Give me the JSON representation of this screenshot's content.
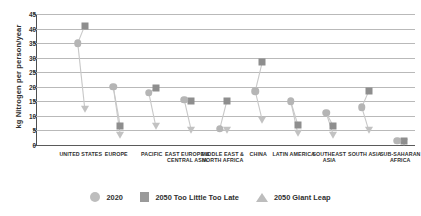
{
  "chart_data": {
    "type": "scatter",
    "title": "",
    "xlabel": "",
    "ylabel": "kg Nitrogen per person/year",
    "ylim": [
      0,
      45
    ],
    "ytick_step": 5,
    "yticks": [
      "45",
      "40",
      "35",
      "30",
      "25",
      "20",
      "15",
      "10",
      "5",
      "0"
    ],
    "grid": true,
    "legend_position": "bottom",
    "categories": [
      "UNITED STATES",
      "EUROPE",
      "PACIFIC",
      "EAST EUROPE & CENTRAL ASIA",
      "MIDDLE EAST & NORTH AFRICA",
      "CHINA",
      "LATIN AMERICA",
      "SOUTHEAST ASIA",
      "SOUTH ASIA",
      "SUB-SAHARAN AFRICA"
    ],
    "series": [
      {
        "name": "2020",
        "marker": "circle",
        "color": "#b5b5b5",
        "values": [
          35.0,
          20.0,
          18.0,
          15.5,
          5.5,
          18.5,
          15.0,
          11.0,
          13.0,
          1.5
        ]
      },
      {
        "name": "2050 Too Little Too Late",
        "marker": "square",
        "color": "#8e8e8e",
        "values": [
          41.0,
          6.5,
          19.5,
          15.0,
          15.0,
          28.5,
          7.0,
          6.5,
          18.5,
          1.5
        ]
      },
      {
        "name": "2050 Giant Leap",
        "marker": "triangle",
        "color": "#c2c2c2",
        "values": [
          12.5,
          3.5,
          6.5,
          5.0,
          5.0,
          8.5,
          4.0,
          3.5,
          5.0,
          1.0
        ]
      }
    ]
  },
  "legend": {
    "items": [
      {
        "label": "2020",
        "marker": "circle"
      },
      {
        "label": "2050 Too Little Too Late",
        "marker": "square"
      },
      {
        "label": "2050 Giant Leap",
        "marker": "triangle"
      }
    ]
  }
}
